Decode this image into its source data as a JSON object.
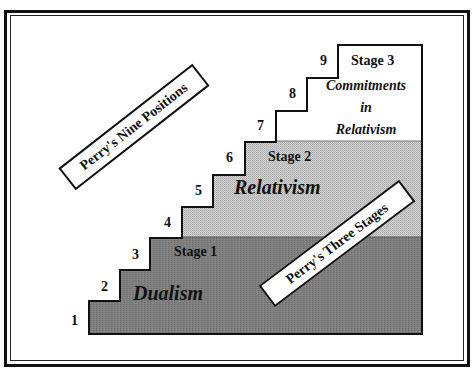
{
  "diagram": {
    "title_tags": {
      "positions": "Perry's Nine Positions",
      "stages": "Perry's Three Stages"
    },
    "positions": [
      "1",
      "2",
      "3",
      "4",
      "5",
      "6",
      "7",
      "8",
      "9"
    ],
    "stages": [
      {
        "label": "Stage 1",
        "name": "Dualism",
        "color": "#7d7d7d"
      },
      {
        "label": "Stage 2",
        "name": "Relativism",
        "color": "#c6c6c6"
      },
      {
        "label": "Stage 3",
        "name_lines": [
          "Commitments",
          "in",
          "Relativism"
        ],
        "color": "#ffffff"
      }
    ]
  }
}
